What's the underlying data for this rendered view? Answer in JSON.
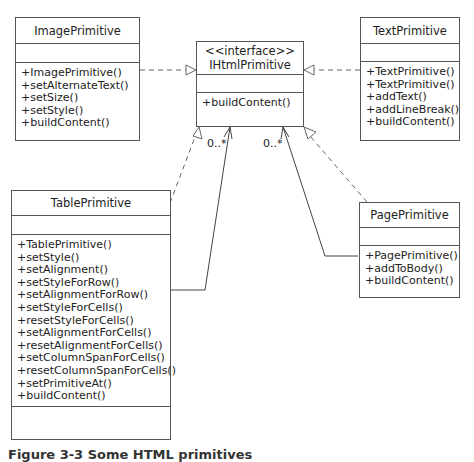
{
  "diagram": {
    "type": "uml-class-diagram",
    "classes": {
      "image": {
        "name": "ImagePrimitive",
        "operations": [
          "+ImagePrimitive()",
          "+setAlternateText()",
          "+setSize()",
          "+setStyle()",
          "+buildContent()"
        ]
      },
      "interface": {
        "stereotype": "<<interface>>",
        "name": "IHtmlPrimitive",
        "operations": [
          "+buildContent()"
        ]
      },
      "text": {
        "name": "TextPrimitive",
        "operations": [
          "+TextPrimitive()",
          "+TextPrimitive()",
          "+addText()",
          "+addLineBreak()",
          "+buildContent()"
        ]
      },
      "table": {
        "name": "TablePrimitive",
        "operations": [
          "+TablePrimitive()",
          "+setStyle()",
          "+setAlignment()",
          "+setStyleForRow()",
          "+setAlignmentForRow()",
          "+setStyleForCells()",
          "+resetStyleForCells()",
          "+setAlignmentForCells()",
          "+resetAlignmentForCells()",
          "+setColumnSpanForCells()",
          "+resetColumnSpanForCells()",
          "+setPrimitiveAt()",
          "+buildContent()"
        ]
      },
      "page": {
        "name": "PagePrimitive",
        "operations": [
          "+PagePrimitive()",
          "+addToBody()",
          "+buildContent()"
        ]
      }
    },
    "relations": [
      {
        "from": "ImagePrimitive",
        "to": "IHtmlPrimitive",
        "kind": "realization"
      },
      {
        "from": "TextPrimitive",
        "to": "IHtmlPrimitive",
        "kind": "realization"
      },
      {
        "from": "TablePrimitive",
        "to": "IHtmlPrimitive",
        "kind": "realization"
      },
      {
        "from": "PagePrimitive",
        "to": "IHtmlPrimitive",
        "kind": "realization"
      },
      {
        "from": "TablePrimitive",
        "to": "IHtmlPrimitive",
        "kind": "association",
        "multiplicity": "0..*"
      },
      {
        "from": "PagePrimitive",
        "to": "IHtmlPrimitive",
        "kind": "association",
        "multiplicity": "0..*"
      }
    ],
    "multiplicities": {
      "table": "0..*",
      "page": "0..*"
    },
    "caption": "Figure 3-3 Some HTML primitives"
  }
}
